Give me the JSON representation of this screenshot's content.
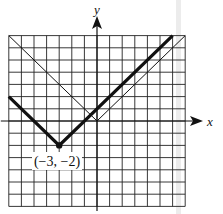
{
  "chart_data": {
    "type": "line",
    "title": "",
    "xlabel": "x",
    "ylabel": "y",
    "xlim": [
      -7,
      7
    ],
    "ylim": [
      -7,
      7
    ],
    "grid": true,
    "grid_step": 1,
    "series": [
      {
        "name": "y = |x + 3| - 2",
        "style": "thick",
        "points": [
          [
            -7,
            2
          ],
          [
            -3,
            -2
          ],
          [
            6,
            7
          ]
        ]
      },
      {
        "name": "y = |x|",
        "style": "thin",
        "points": [
          [
            -7,
            7
          ],
          [
            0,
            0
          ],
          [
            7,
            7
          ]
        ]
      }
    ],
    "annotations": [
      {
        "text": "(−3, −2)",
        "x": -3,
        "y": -2,
        "marker": "dot"
      }
    ]
  },
  "labels": {
    "x_axis": "x",
    "y_axis": "y",
    "vertex": "(−3, −2)"
  },
  "colors": {
    "ink": "#111111",
    "grid": "#222222",
    "scan_band": "#e6e6e6"
  }
}
